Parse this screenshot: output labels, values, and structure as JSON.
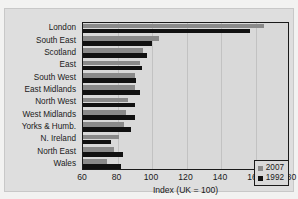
{
  "chart_data": {
    "type": "bar",
    "orientation": "horizontal",
    "title": "",
    "xlabel": "Index (UK = 100)",
    "ylabel": "",
    "xlim": [
      60,
      180
    ],
    "xticks": [
      60,
      80,
      100,
      120,
      140,
      160,
      180
    ],
    "grid": true,
    "legend_position": "bottom-right",
    "categories": [
      "London",
      "South East",
      "Scotland",
      "East",
      "South West",
      "East Midlands",
      "North West",
      "West Midlands",
      "Yorks & Humb.",
      "N. Ireland",
      "North East",
      "Wales"
    ],
    "series": [
      {
        "name": "2007",
        "color": "#8a8a8a",
        "values": [
          165,
          104,
          95,
          93,
          90,
          90,
          86,
          85,
          84,
          81,
          78,
          74
        ]
      },
      {
        "name": "1992",
        "color": "#111111",
        "values": [
          157,
          100,
          97,
          94,
          91,
          93,
          90,
          90,
          88,
          76,
          83,
          82
        ]
      }
    ]
  },
  "legend": {
    "items": [
      {
        "label": "2007",
        "color": "#8a8a8a"
      },
      {
        "label": "1992",
        "color": "#111111"
      }
    ]
  }
}
